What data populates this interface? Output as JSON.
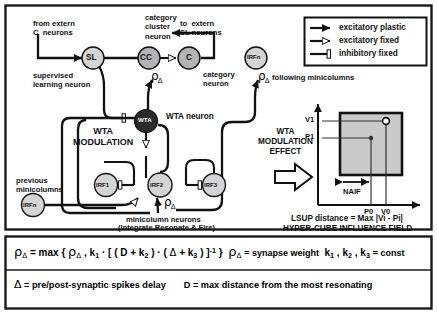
{
  "figure": {
    "border_color": "#1a1a1a",
    "background": "#ffffff",
    "node_fill_light": "#d4d4d4",
    "node_fill_mid": "#b3b3b3",
    "node_fill_dark": "#2b2b2b",
    "panel_fill": "#c9c9c9"
  },
  "labels": {
    "from_extern_c": "from extern\nC  neurons",
    "category_cluster_neuron": "category\ncluster\nneuron",
    "to_extern_sl": "to  extern\nSL neurons",
    "supervised_learning_neuron": "supervised\nlearning neuron",
    "category_neuron": "category\nneuron",
    "following_minicolumns": "following minicolumns",
    "wta_neuron": "WTA neuron",
    "wta_modulation": "WTA\nMODULATION",
    "wta_modulation_effect": "WTA\nMODULATION\nEFFECT",
    "previous_minicolumns": "previous\nminicolumns",
    "minicolumn_neurons": "minicolumn  neurons",
    "integrate_resonate_fire": "(Integrate Resonate & Fire)",
    "lsup_distance": "LSUP distance = Max |Vi - Pi|",
    "hypercube_influence_field": "HYPER-CUBE INFLUENCE FIELD",
    "naif": "NAIF"
  },
  "nodes": {
    "sl": "SL",
    "cc": "CC",
    "c": "C",
    "irfn_top": "IRFn",
    "wta": "WTA",
    "irf1": "IRF1",
    "irf2": "IRF2",
    "irf3": "IRF3",
    "irfn_left": "IRFn"
  },
  "legend": {
    "items": [
      {
        "label": "excitatory plastic",
        "symbol": "filled-triangle"
      },
      {
        "label": "excitatory fixed",
        "symbol": "open-triangle"
      },
      {
        "label": "inhibitory fixed",
        "symbol": "bar-terminal"
      }
    ]
  },
  "plot": {
    "y_ticks": [
      "V1",
      "P1"
    ],
    "x_ticks": [
      "P0",
      "V0"
    ],
    "region_label": "NAIF"
  },
  "formulas": {
    "line1_left_rho": "ρ",
    "line1": "ρΔ = max { ρΔ , k1 · [ ( D + k2 ) · ( Δ + k3 ) ] -1 }",
    "line1_right_a": "= synapse weight",
    "line1_right_b": "= const",
    "line2_left": "= pre/post-synaptic spikes delay",
    "line2_right": "= max distance from the most resonating",
    "delta": "Δ",
    "d_symbol": "D"
  }
}
